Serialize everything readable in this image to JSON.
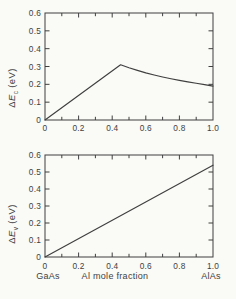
{
  "figure": {
    "background": "#fafaf6",
    "line_color": "#3f3f3f",
    "text_color": "#3f3f3f"
  },
  "chart_data": [
    {
      "type": "line",
      "panel": "top",
      "ylabel": "ΔEc (eV)",
      "ylabel_parts": {
        "delta": "Δ",
        "symbol": "E",
        "sub": "c",
        "unit": "(eV)"
      },
      "xlabel": "",
      "xlim": [
        0,
        1.0
      ],
      "ylim": [
        0,
        0.6
      ],
      "x_major_ticks": [
        0,
        0.2,
        0.4,
        0.6,
        0.8,
        1.0
      ],
      "x_tick_labels": [
        "0",
        "0.2",
        "0.4",
        "0.6",
        "0.8",
        "1.0"
      ],
      "x_minor_ticks": [
        0.1,
        0.3,
        0.5,
        0.7,
        0.9
      ],
      "y_ticks": [
        0,
        0.1,
        0.2,
        0.3,
        0.4,
        0.5,
        0.6
      ],
      "y_tick_labels": [
        "0",
        "0.1",
        "0.2",
        "0.3",
        "0.4",
        "0.5",
        "0.6"
      ],
      "grid": false,
      "series": [
        {
          "x": [
            0,
            0.45,
            0.5,
            0.55,
            0.6,
            0.65,
            0.7,
            0.75,
            0.8,
            0.85,
            0.9,
            0.95,
            1.0
          ],
          "y": [
            0,
            0.31,
            0.293,
            0.278,
            0.264,
            0.252,
            0.241,
            0.231,
            0.222,
            0.214,
            0.206,
            0.198,
            0.19
          ]
        }
      ]
    },
    {
      "type": "line",
      "panel": "bottom",
      "ylabel": "ΔEv (eV)",
      "ylabel_parts": {
        "delta": "Δ",
        "symbol": "E",
        "sub": "v",
        "unit": "(eV)"
      },
      "xlabel": "Al mole fraction",
      "x_end_labels": {
        "left": "GaAs",
        "right": "AlAs"
      },
      "xlim": [
        0,
        1.0
      ],
      "ylim": [
        0,
        0.6
      ],
      "x_major_ticks": [
        0,
        0.2,
        0.4,
        0.6,
        0.8,
        1.0
      ],
      "x_tick_labels": [
        "0",
        "0.2",
        "0.4",
        "0.6",
        "0.8",
        "1.0"
      ],
      "x_minor_ticks": [
        0.1,
        0.3,
        0.5,
        0.7,
        0.9
      ],
      "y_ticks": [
        0,
        0.1,
        0.2,
        0.3,
        0.4,
        0.5,
        0.6
      ],
      "y_tick_labels": [
        "0",
        "0.1",
        "0.2",
        "0.3",
        "0.4",
        "0.5",
        "0.6"
      ],
      "grid": false,
      "series": [
        {
          "x": [
            0,
            1.0
          ],
          "y": [
            0,
            0.54
          ]
        }
      ]
    }
  ]
}
